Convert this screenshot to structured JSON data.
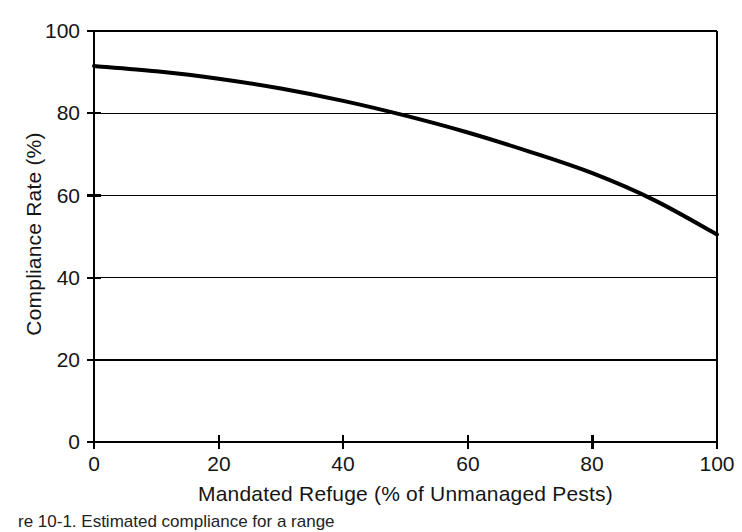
{
  "chart_data": {
    "type": "line",
    "title": "",
    "subtitle": "",
    "xlabel": "Mandated Refuge (% of Unmanaged Pests)",
    "ylabel": "Compliance Rate (%)",
    "xlim": [
      0,
      100
    ],
    "ylim": [
      0,
      100
    ],
    "xticks": [
      "0",
      "20",
      "40",
      "60",
      "80",
      "100"
    ],
    "yticks": [
      "0",
      "20",
      "40",
      "60",
      "80",
      "100"
    ],
    "xtick_values": [
      0,
      20,
      40,
      60,
      80,
      100
    ],
    "ytick_values": [
      0,
      20,
      40,
      60,
      80,
      100
    ],
    "grid": "horizontal",
    "legend": "none",
    "line_color": "#000000",
    "line_width": 4,
    "series": [
      {
        "name": "Compliance Rate",
        "x": [
          0,
          10,
          20,
          30,
          40,
          50,
          60,
          70,
          80,
          90,
          100
        ],
        "values": [
          91.5,
          90.2,
          88.4,
          86.0,
          83.0,
          79.4,
          75.3,
          70.6,
          65.4,
          58.8,
          50.5
        ]
      }
    ],
    "annotations": []
  },
  "figure": {
    "caption": "re 10-1. Estimated compliance for a range",
    "axis_color": "#000000",
    "background": "#ffffff"
  }
}
